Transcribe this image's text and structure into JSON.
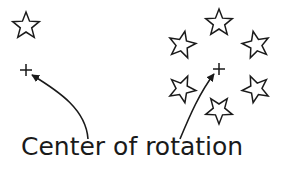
{
  "caption": "Center of rotation",
  "colors": {
    "stroke": "#1a1a1a",
    "background": "#ffffff"
  },
  "left_figure": {
    "star": {
      "cx": 26,
      "cy": 26
    },
    "center_marker": {
      "x": 26,
      "y": 70
    }
  },
  "right_figure": {
    "center_marker": {
      "x": 219,
      "y": 69
    },
    "stars": [
      {
        "cx": 219,
        "cy": 23
      },
      {
        "cx": 256,
        "cy": 45
      },
      {
        "cx": 256,
        "cy": 89
      },
      {
        "cx": 219,
        "cy": 110
      },
      {
        "cx": 182,
        "cy": 89
      },
      {
        "cx": 182,
        "cy": 45
      }
    ]
  }
}
